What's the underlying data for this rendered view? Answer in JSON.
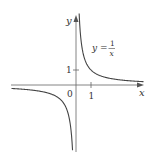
{
  "chart_data": {
    "type": "line",
    "title": "",
    "function": "y = 1/x",
    "annotation": {
      "text_lhs": "y =",
      "numerator": "1",
      "denominator": "x"
    },
    "xlabel": "x",
    "ylabel": "y",
    "origin_label": "0",
    "x_ticks": [
      {
        "value": 1,
        "label": "1"
      }
    ],
    "y_ticks": [
      {
        "value": 1,
        "label": "1"
      }
    ],
    "xlim": [
      -4.3,
      4.5
    ],
    "ylim": [
      -4.3,
      4.8
    ],
    "grid": false,
    "series": [
      {
        "name": "y = 1/x (x<0)",
        "x": [
          -4.3,
          -3,
          -2,
          -1,
          -0.5,
          -0.3,
          -0.23
        ],
        "y": [
          -0.23,
          -0.33,
          -0.5,
          -1,
          -2,
          -3.33,
          -4.3
        ]
      },
      {
        "name": "y = 1/x (x>0)",
        "x": [
          0.21,
          0.3,
          0.5,
          1,
          2,
          3,
          4.5
        ],
        "y": [
          4.8,
          3.33,
          2,
          1,
          0.5,
          0.33,
          0.22
        ]
      }
    ],
    "line_color": "#444444",
    "axis_color": "#555555"
  }
}
